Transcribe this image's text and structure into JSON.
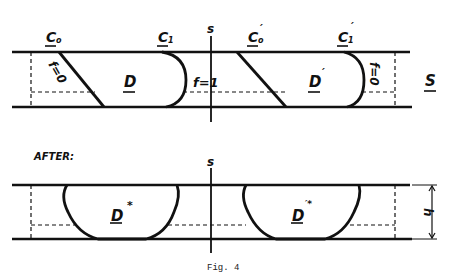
{
  "figure": {
    "caption": "Fig. 4",
    "section_label_after": "AFTER:",
    "before": {
      "labels": {
        "c0": "C",
        "c0_sub": "o",
        "c1": "C",
        "c1_sub": "1",
        "c0_prime": "C",
        "c0_prime_sub": "o",
        "c0_prime_mark": "′",
        "c1_prime": "C",
        "c1_prime_sub": "1",
        "c1_prime_mark": "′",
        "axis": "s",
        "region_d": "D",
        "region_d_prime": "D",
        "region_d_prime_mark": "′",
        "f_zero_left": "f=0",
        "f_one": "f=1",
        "f_zero_right": "f=0",
        "strip": "S"
      }
    },
    "after": {
      "labels": {
        "axis": "s",
        "region_d_star": "D",
        "region_d_star_mark": "*",
        "region_d_prime_star": "D",
        "region_d_prime_star_mark": "′*",
        "height": "h"
      }
    }
  }
}
